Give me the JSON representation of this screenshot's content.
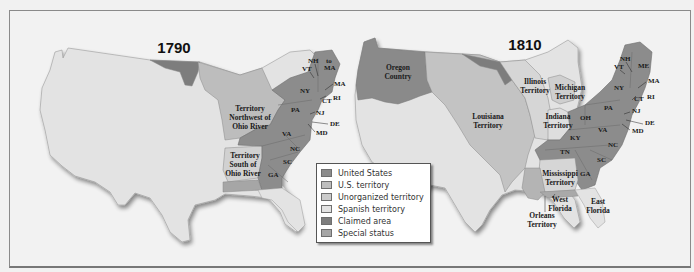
{
  "colors": {
    "united_states": "#8c8c8c",
    "us_territory": "#bdbdbd",
    "unorganized_territory": "#cbcbcb",
    "spanish_territory": "#e3e3e3",
    "claimed_area": "#7d7d7d",
    "special_status": "#a6a6a6",
    "background": "#f2f2f2"
  },
  "maps": [
    {
      "title": "1790",
      "labels": {
        "territory_northwest": [
          "Territory",
          "Northwest of",
          "Ohio River"
        ],
        "territory_south": [
          "Territory",
          "South of",
          "Ohio River"
        ],
        "states": [
          "NH",
          "VT",
          "to",
          "MA",
          "MA",
          "NY",
          "CT",
          "RI",
          "PA",
          "NJ",
          "DE",
          "MD",
          "VA",
          "NC",
          "SC",
          "GA"
        ]
      }
    },
    {
      "title": "1810",
      "labels": {
        "oregon": [
          "Oregon",
          "Country"
        ],
        "louisiana": [
          "Louisiana",
          "Territory"
        ],
        "illinois": [
          "Illinois",
          "Territory"
        ],
        "michigan": [
          "Michigan",
          "Territory"
        ],
        "indiana": [
          "Indiana",
          "Territory"
        ],
        "mississippi": [
          "Mississippi",
          "Territory"
        ],
        "orleans": [
          "Orleans",
          "Territory"
        ],
        "west_florida": [
          "West",
          "Florida"
        ],
        "east_florida": [
          "East",
          "Florida"
        ],
        "states": [
          "NH",
          "VT",
          "ME",
          "MA",
          "NY",
          "CT",
          "RI",
          "PA",
          "NJ",
          "DE",
          "MD",
          "OH",
          "VA",
          "KY",
          "NC",
          "TN",
          "SC",
          "GA"
        ]
      }
    }
  ],
  "legend": {
    "items": [
      {
        "label": "United States",
        "key": "united_states"
      },
      {
        "label": "U.S. territory",
        "key": "us_territory"
      },
      {
        "label": "Unorganized territory",
        "key": "unorganized_territory"
      },
      {
        "label": "Spanish territory",
        "key": "spanish_territory"
      },
      {
        "label": "Claimed area",
        "key": "claimed_area"
      },
      {
        "label": "Special status",
        "key": "special_status"
      }
    ]
  }
}
